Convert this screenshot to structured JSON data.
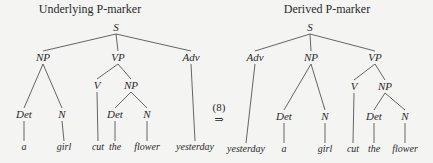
{
  "colors": {
    "background": "#f4f4f2",
    "ink": "#2a2a2a",
    "edge": "#555555"
  },
  "transformation": {
    "label": "(8)",
    "arrow": "⇒",
    "x": 219,
    "label_y": 111,
    "arrow_y": 123
  },
  "trees": [
    {
      "id": "underlying",
      "title": "Underlying P-marker",
      "title_x": 90,
      "title_y": 13,
      "nodes": [
        {
          "id": "S",
          "label": "S",
          "x": 116,
          "y": 31,
          "type": "node"
        },
        {
          "id": "NP",
          "label": "NP",
          "x": 43,
          "y": 61,
          "type": "node"
        },
        {
          "id": "VP",
          "label": "VP",
          "x": 118,
          "y": 61,
          "type": "node"
        },
        {
          "id": "Adv",
          "label": "Adv",
          "x": 191,
          "y": 61,
          "type": "node"
        },
        {
          "id": "Det1",
          "label": "Det",
          "x": 24,
          "y": 118,
          "type": "node"
        },
        {
          "id": "N1",
          "label": "N",
          "x": 62,
          "y": 118,
          "type": "node"
        },
        {
          "id": "V",
          "label": "V",
          "x": 97,
          "y": 89,
          "type": "node"
        },
        {
          "id": "NP2",
          "label": "NP",
          "x": 131,
          "y": 89,
          "type": "node"
        },
        {
          "id": "Det2",
          "label": "Det",
          "x": 115,
          "y": 118,
          "type": "node"
        },
        {
          "id": "N2",
          "label": "N",
          "x": 147,
          "y": 118,
          "type": "node"
        },
        {
          "id": "a",
          "label": "a",
          "x": 24,
          "y": 150,
          "type": "leaf"
        },
        {
          "id": "girl",
          "label": "girl",
          "x": 64,
          "y": 150,
          "type": "leaf"
        },
        {
          "id": "cut",
          "label": "cut",
          "x": 98,
          "y": 150,
          "type": "leaf"
        },
        {
          "id": "the",
          "label": "the",
          "x": 115,
          "y": 150,
          "type": "leaf"
        },
        {
          "id": "flower",
          "label": "flower",
          "x": 147,
          "y": 150,
          "type": "leaf"
        },
        {
          "id": "yesterday",
          "label": "yesterday",
          "x": 195,
          "y": 150,
          "type": "leaf"
        }
      ],
      "edges": [
        [
          "S",
          "NP"
        ],
        [
          "S",
          "VP"
        ],
        [
          "S",
          "Adv"
        ],
        [
          "NP",
          "Det1"
        ],
        [
          "NP",
          "N1"
        ],
        [
          "VP",
          "V"
        ],
        [
          "VP",
          "NP2"
        ],
        [
          "NP2",
          "Det2"
        ],
        [
          "NP2",
          "N2"
        ],
        [
          "Det1",
          "a"
        ],
        [
          "N1",
          "girl"
        ],
        [
          "V",
          "cut"
        ],
        [
          "Det2",
          "the"
        ],
        [
          "N2",
          "flower"
        ],
        [
          "Adv",
          "yesterday"
        ]
      ]
    },
    {
      "id": "derived",
      "title": "Derived P-marker",
      "title_x": 327,
      "title_y": 13,
      "nodes": [
        {
          "id": "S",
          "label": "S",
          "x": 310,
          "y": 31,
          "type": "node"
        },
        {
          "id": "Adv",
          "label": "Adv",
          "x": 255,
          "y": 61,
          "type": "node"
        },
        {
          "id": "NP",
          "label": "NP",
          "x": 311,
          "y": 61,
          "type": "node"
        },
        {
          "id": "VP",
          "label": "VP",
          "x": 375,
          "y": 61,
          "type": "node"
        },
        {
          "id": "Det1",
          "label": "Det",
          "x": 284,
          "y": 120,
          "type": "node"
        },
        {
          "id": "N1",
          "label": "N",
          "x": 325,
          "y": 120,
          "type": "node"
        },
        {
          "id": "V",
          "label": "V",
          "x": 354,
          "y": 90,
          "type": "node"
        },
        {
          "id": "NP2",
          "label": "NP",
          "x": 385,
          "y": 90,
          "type": "node"
        },
        {
          "id": "Det2",
          "label": "Det",
          "x": 374,
          "y": 120,
          "type": "node"
        },
        {
          "id": "N2",
          "label": "N",
          "x": 405,
          "y": 120,
          "type": "node"
        },
        {
          "id": "yesterday",
          "label": "yesterday",
          "x": 246,
          "y": 152,
          "type": "leaf"
        },
        {
          "id": "a",
          "label": "a",
          "x": 284,
          "y": 152,
          "type": "leaf"
        },
        {
          "id": "girl",
          "label": "girl",
          "x": 325,
          "y": 152,
          "type": "leaf"
        },
        {
          "id": "cut",
          "label": "cut",
          "x": 353,
          "y": 152,
          "type": "leaf"
        },
        {
          "id": "the",
          "label": "the",
          "x": 374,
          "y": 152,
          "type": "leaf"
        },
        {
          "id": "flower",
          "label": "flower",
          "x": 405,
          "y": 152,
          "type": "leaf"
        }
      ],
      "edges": [
        [
          "S",
          "Adv"
        ],
        [
          "S",
          "NP"
        ],
        [
          "S",
          "VP"
        ],
        [
          "NP",
          "Det1"
        ],
        [
          "NP",
          "N1"
        ],
        [
          "VP",
          "V"
        ],
        [
          "VP",
          "NP2"
        ],
        [
          "NP2",
          "Det2"
        ],
        [
          "NP2",
          "N2"
        ],
        [
          "Adv",
          "yesterday"
        ],
        [
          "Det1",
          "a"
        ],
        [
          "N1",
          "girl"
        ],
        [
          "V",
          "cut"
        ],
        [
          "Det2",
          "the"
        ],
        [
          "N2",
          "flower"
        ]
      ]
    }
  ]
}
